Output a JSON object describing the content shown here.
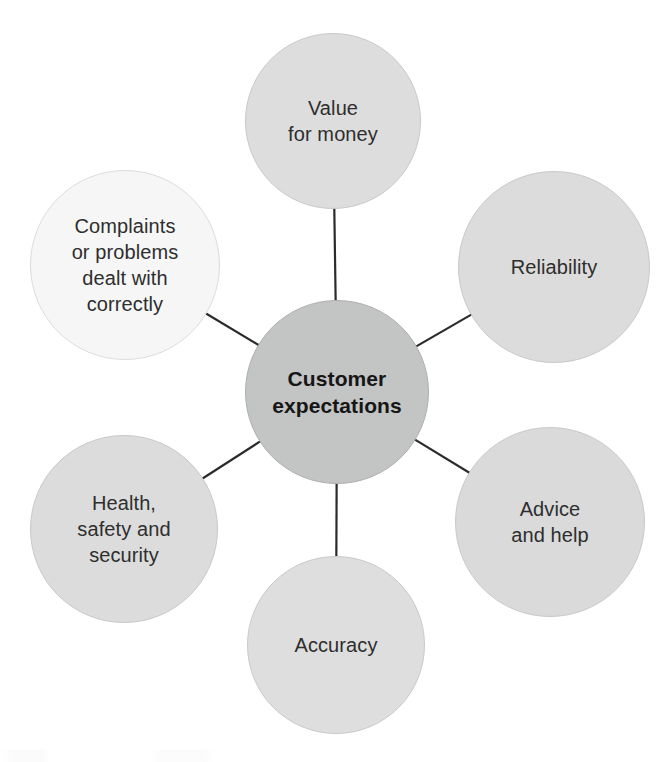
{
  "diagram": {
    "type": "hub-and-spoke",
    "title": "Customer expectations",
    "background_color": "#ffffff",
    "connector_color": "#2b2b2b",
    "hub": {
      "id": "customer-expectations",
      "label": "Customer\nexpectations",
      "cx": 337,
      "cy": 392,
      "r": 92,
      "fill": "#c3c4c4",
      "stroke": "#aeaeae",
      "text_color": "#161616",
      "bold": true
    },
    "satellites": [
      {
        "id": "value-for-money",
        "label": "Value\nfor money",
        "cx": 333,
        "cy": 121,
        "r": 88,
        "fill": "#dddddd",
        "stroke": "#c9c9c9",
        "text_color": "#2e2e2e"
      },
      {
        "id": "reliability",
        "label": "Reliability",
        "cx": 554,
        "cy": 267,
        "r": 96,
        "fill": "#dcdcdc",
        "stroke": "#c9c9c9",
        "text_color": "#2e2e2e"
      },
      {
        "id": "advice-and-help",
        "label": "Advice\nand help",
        "cx": 550,
        "cy": 522,
        "r": 95,
        "fill": "#dadada",
        "stroke": "#c9c9c9",
        "text_color": "#2e2e2e"
      },
      {
        "id": "accuracy",
        "label": "Accuracy",
        "cx": 336,
        "cy": 645,
        "r": 89,
        "fill": "#dedede",
        "stroke": "#c9c9c9",
        "text_color": "#2e2e2e"
      },
      {
        "id": "health-safety-and-security",
        "label": "Health,\nsafety and\nsecurity",
        "cx": 124,
        "cy": 529,
        "r": 94,
        "fill": "#dcdcdc",
        "stroke": "#c9c9c9",
        "text_color": "#2e2e2e"
      },
      {
        "id": "complaints-or-problems-dealt-with-correctly",
        "label": "Complaints\nor problems\ndealt with\ncorrectly",
        "cx": 125,
        "cy": 265,
        "r": 95,
        "fill": "#f6f6f6",
        "stroke": "#dcdcdc",
        "text_color": "#2e2e2e"
      }
    ],
    "connectors": [
      {
        "id": "hub-to-value-for-money",
        "from": "customer-expectations",
        "to": "value-for-money"
      },
      {
        "id": "hub-to-reliability",
        "from": "customer-expectations",
        "to": "reliability"
      },
      {
        "id": "hub-to-advice-and-help",
        "from": "customer-expectations",
        "to": "advice-and-help"
      },
      {
        "id": "hub-to-accuracy",
        "from": "customer-expectations",
        "to": "accuracy"
      },
      {
        "id": "hub-to-health-safety",
        "from": "customer-expectations",
        "to": "health-safety-and-security"
      },
      {
        "id": "hub-to-complaints",
        "from": "customer-expectations",
        "to": "complaints-or-problems-dealt-with-correctly"
      }
    ]
  }
}
